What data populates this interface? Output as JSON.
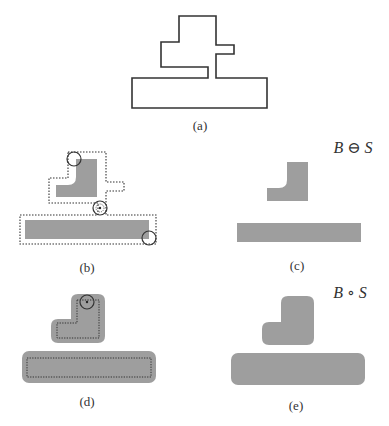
{
  "figure": {
    "panels": [
      {
        "id": "a",
        "caption": "(a)",
        "description": "Original set B outline"
      },
      {
        "id": "b",
        "caption": "(b)",
        "description": "Structuring element S rolled inside boundary of B; gray = erosion result"
      },
      {
        "id": "c",
        "caption": "(c)",
        "description": "Erosion result",
        "formula": "B ⊖ S"
      },
      {
        "id": "d",
        "caption": "(d)",
        "description": "Dilation of eroded set by S; dotted = eroded set"
      },
      {
        "id": "e",
        "caption": "(e)",
        "description": "Opening result",
        "formula": "B ∘ S"
      }
    ],
    "colors": {
      "fill": "#9e9e9e",
      "stroke": "#333333",
      "background": "#ffffff"
    }
  }
}
